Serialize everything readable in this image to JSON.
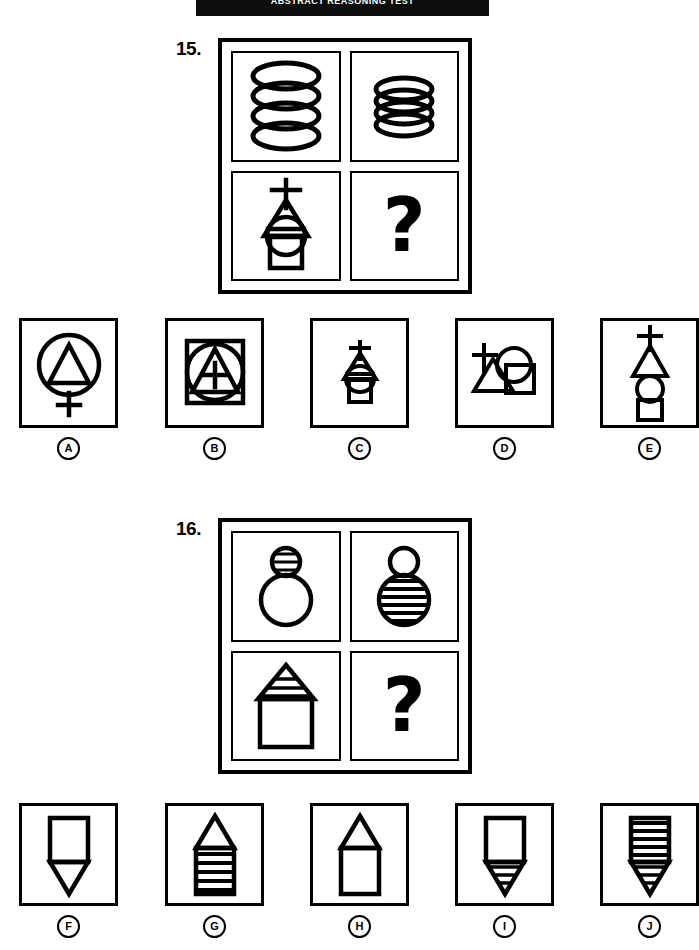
{
  "banner": {
    "text": "ABSTRACT REASONING TEST",
    "visible_as": "cropped-black-bar"
  },
  "puzzles": [
    {
      "number": "15.",
      "matrix": {
        "cells": [
          {
            "position": "top-left",
            "content": "tall-coil-spiral",
            "is_question": false
          },
          {
            "position": "top-right",
            "content": "compressed-coil-spiral",
            "is_question": false
          },
          {
            "position": "bottom-left",
            "content": "cross-triangle-striped-circle-square-compressed",
            "is_question": false
          },
          {
            "position": "bottom-right",
            "content": "question-mark",
            "is_question": true,
            "label": "?"
          }
        ]
      },
      "options": [
        {
          "letter": "A",
          "content": "circle-with-triangle-and-cross-below"
        },
        {
          "letter": "B",
          "content": "square-with-circle-triangle-cross-inside"
        },
        {
          "letter": "C",
          "content": "cross-triangle-circle-square-compressed"
        },
        {
          "letter": "D",
          "content": "scattered-overlapping-cross-triangle-circle-square"
        },
        {
          "letter": "E",
          "content": "cross-triangle-circle-square-stacked-expanded"
        }
      ]
    },
    {
      "number": "16.",
      "matrix": {
        "cells": [
          {
            "position": "top-left",
            "content": "small-striped-circle-above-large-plain-circle",
            "is_question": false
          },
          {
            "position": "top-right",
            "content": "small-plain-circle-above-large-striped-circle",
            "is_question": false
          },
          {
            "position": "bottom-left",
            "content": "striped-triangle-roof-on-plain-square",
            "is_question": false
          },
          {
            "position": "bottom-right",
            "content": "question-mark",
            "is_question": true,
            "label": "?"
          }
        ]
      },
      "options": [
        {
          "letter": "F",
          "content": "plain-square-with-plain-down-triangle"
        },
        {
          "letter": "G",
          "content": "plain-triangle-roof-on-striped-square"
        },
        {
          "letter": "H",
          "content": "plain-triangle-roof-on-plain-square"
        },
        {
          "letter": "I",
          "content": "plain-square-with-striped-down-triangle"
        },
        {
          "letter": "J",
          "content": "striped-square-with-striped-down-triangle"
        }
      ]
    }
  ],
  "colors": {
    "ink": "#000000",
    "paper": "#ffffff",
    "banner_bg": "#0d0d0d"
  }
}
